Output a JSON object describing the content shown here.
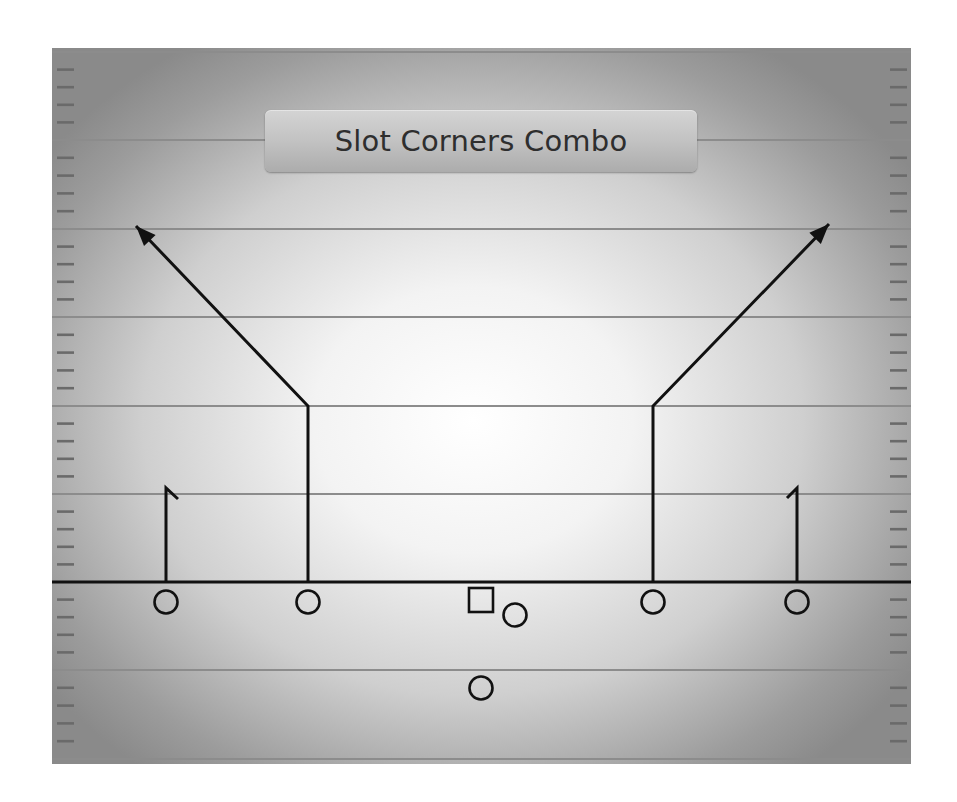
{
  "title": "Slot Corners Combo",
  "colors": {
    "route": "#111111",
    "yard_line": "#8c8c8c",
    "hash": "#6a6a6a",
    "field_center": "#ffffff",
    "field_edge": "#8a8a8a"
  },
  "field": {
    "yard_lines_y": [
      52,
      140,
      229,
      317,
      406,
      494,
      670,
      759
    ],
    "line_of_scrimmage_y": 582,
    "hash_marks_per_gap": 4
  },
  "players": [
    {
      "id": "left-wr",
      "shape": "circle",
      "x": 166,
      "y": 602
    },
    {
      "id": "left-slot",
      "shape": "circle",
      "x": 308,
      "y": 602
    },
    {
      "id": "center",
      "shape": "square",
      "x": 481,
      "y": 600
    },
    {
      "id": "quarterback",
      "shape": "circle",
      "x": 515,
      "y": 615
    },
    {
      "id": "running-back",
      "shape": "circle",
      "x": 481,
      "y": 688
    },
    {
      "id": "right-slot",
      "shape": "circle",
      "x": 653,
      "y": 602
    },
    {
      "id": "right-wr",
      "shape": "circle",
      "x": 797,
      "y": 602
    }
  ],
  "routes": [
    {
      "id": "left-wr-hitch",
      "type": "hitch",
      "points": [
        [
          166,
          582
        ],
        [
          166,
          488
        ],
        [
          178,
          499
        ]
      ]
    },
    {
      "id": "left-slot-corner",
      "type": "corner",
      "points": [
        [
          308,
          582
        ],
        [
          308,
          406
        ],
        [
          136,
          226
        ]
      ],
      "arrow": true
    },
    {
      "id": "right-slot-corner",
      "type": "corner",
      "points": [
        [
          653,
          582
        ],
        [
          653,
          406
        ],
        [
          829,
          224
        ]
      ],
      "arrow": true
    },
    {
      "id": "right-wr-hitch",
      "type": "hitch",
      "points": [
        [
          797,
          582
        ],
        [
          797,
          488
        ],
        [
          787,
          498
        ]
      ]
    }
  ]
}
